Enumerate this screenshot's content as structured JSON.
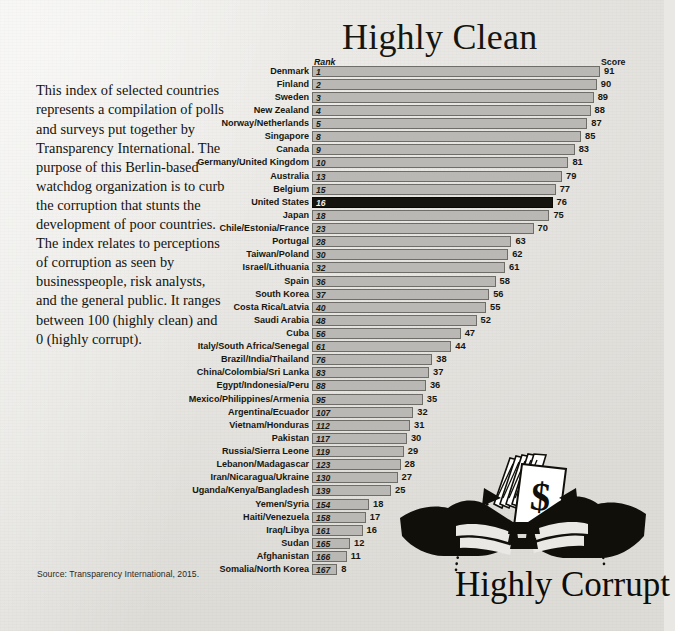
{
  "titles": {
    "top": "Highly Clean",
    "bottom": "Highly Corrupt"
  },
  "intro_paragraph": "This index of selected countries represents a compilation of polls and surveys put together by Transparency International. The purpose of this Berlin-based watchdog organization is to curb the corruption that stunts the development of poor countries. The index relates to perceptions of corruption as seen by businesspeople, risk analysts, and the general public. It ranges between 100 (highly clean) and 0 (highly corrupt).",
  "source": "Source: Transparency International, 2015.",
  "columns": {
    "rank": "Rank",
    "score": "Score"
  },
  "colors": {
    "paper": "#e9e8e4",
    "bar_fill": "#b9b8b4",
    "bar_stroke": "#6e6d68",
    "highlight_fill": "#15140f",
    "text": "#17160f"
  },
  "highlighted_row": "United States",
  "illustration": {
    "name": "bribery-handshake-money",
    "description": "Two black silhouetted hands passing a fan of dollar bills, with dotted curved arrows",
    "currency_symbol": "$"
  },
  "chart_data": {
    "type": "bar",
    "orientation": "horizontal",
    "title": "Highly Clean",
    "subtitle": "Highly Corrupt",
    "xlabel": "Score",
    "ylabel": "",
    "xlim": [
      0,
      91
    ],
    "grid": false,
    "legend": false,
    "value_labels": true,
    "categories": [
      "Denmark",
      "Finland",
      "Sweden",
      "New Zealand",
      "Norway/Netherlands",
      "Singapore",
      "Canada",
      "Germany/United Kingdom",
      "Australia",
      "Belgium",
      "United States",
      "Japan",
      "Chile/Estonia/France",
      "Portugal",
      "Taiwan/Poland",
      "Israel/Lithuania",
      "Spain",
      "South Korea",
      "Costa Rica/Latvia",
      "Saudi Arabia",
      "Cuba",
      "Italy/South Africa/Senegal",
      "Brazil/India/Thailand",
      "China/Colombia/Sri Lanka",
      "Egypt/Indonesia/Peru",
      "Mexico/Philippines/Armenia",
      "Argentina/Ecuador",
      "Vietnam/Honduras",
      "Pakistan",
      "Russia/Sierra Leone",
      "Lebanon/Madagascar",
      "Iran/Nicaragua/Ukraine",
      "Uganda/Kenya/Bangladesh",
      "Yemen/Syria",
      "Haiti/Venezuela",
      "Iraq/Libya",
      "Sudan",
      "Afghanistan",
      "Somalia/North Korea"
    ],
    "values": [
      91,
      90,
      89,
      88,
      87,
      85,
      83,
      81,
      79,
      77,
      76,
      75,
      70,
      63,
      62,
      61,
      58,
      56,
      55,
      52,
      47,
      44,
      38,
      37,
      36,
      35,
      32,
      31,
      30,
      29,
      28,
      27,
      25,
      18,
      17,
      16,
      12,
      11,
      8
    ],
    "ranks": [
      1,
      2,
      3,
      4,
      5,
      8,
      9,
      10,
      13,
      15,
      16,
      18,
      23,
      28,
      30,
      32,
      36,
      37,
      40,
      48,
      56,
      61,
      76,
      83,
      88,
      95,
      107,
      112,
      117,
      119,
      123,
      130,
      139,
      154,
      158,
      161,
      165,
      166,
      167
    ]
  },
  "rows": [
    {
      "country": "Denmark",
      "rank": "1",
      "score": "91"
    },
    {
      "country": "Finland",
      "rank": "2",
      "score": "90"
    },
    {
      "country": "Sweden",
      "rank": "3",
      "score": "89"
    },
    {
      "country": "New Zealand",
      "rank": "4",
      "score": "88"
    },
    {
      "country": "Norway/Netherlands",
      "rank": "5",
      "score": "87"
    },
    {
      "country": "Singapore",
      "rank": "8",
      "score": "85"
    },
    {
      "country": "Canada",
      "rank": "9",
      "score": "83"
    },
    {
      "country": "Germany/United Kingdom",
      "rank": "10",
      "score": "81"
    },
    {
      "country": "Australia",
      "rank": "13",
      "score": "79"
    },
    {
      "country": "Belgium",
      "rank": "15",
      "score": "77"
    },
    {
      "country": "United States",
      "rank": "16",
      "score": "76"
    },
    {
      "country": "Japan",
      "rank": "18",
      "score": "75"
    },
    {
      "country": "Chile/Estonia/France",
      "rank": "23",
      "score": "70"
    },
    {
      "country": "Portugal",
      "rank": "28",
      "score": "63"
    },
    {
      "country": "Taiwan/Poland",
      "rank": "30",
      "score": "62"
    },
    {
      "country": "Israel/Lithuania",
      "rank": "32",
      "score": "61"
    },
    {
      "country": "Spain",
      "rank": "36",
      "score": "58"
    },
    {
      "country": "South Korea",
      "rank": "37",
      "score": "56"
    },
    {
      "country": "Costa Rica/Latvia",
      "rank": "40",
      "score": "55"
    },
    {
      "country": "Saudi Arabia",
      "rank": "48",
      "score": "52"
    },
    {
      "country": "Cuba",
      "rank": "56",
      "score": "47"
    },
    {
      "country": "Italy/South Africa/Senegal",
      "rank": "61",
      "score": "44"
    },
    {
      "country": "Brazil/India/Thailand",
      "rank": "76",
      "score": "38"
    },
    {
      "country": "China/Colombia/Sri Lanka",
      "rank": "83",
      "score": "37"
    },
    {
      "country": "Egypt/Indonesia/Peru",
      "rank": "88",
      "score": "36"
    },
    {
      "country": "Mexico/Philippines/Armenia",
      "rank": "95",
      "score": "35"
    },
    {
      "country": "Argentina/Ecuador",
      "rank": "107",
      "score": "32"
    },
    {
      "country": "Vietnam/Honduras",
      "rank": "112",
      "score": "31"
    },
    {
      "country": "Pakistan",
      "rank": "117",
      "score": "30"
    },
    {
      "country": "Russia/Sierra Leone",
      "rank": "119",
      "score": "29"
    },
    {
      "country": "Lebanon/Madagascar",
      "rank": "123",
      "score": "28"
    },
    {
      "country": "Iran/Nicaragua/Ukraine",
      "rank": "130",
      "score": "27"
    },
    {
      "country": "Uganda/Kenya/Bangladesh",
      "rank": "139",
      "score": "25"
    },
    {
      "country": "Yemen/Syria",
      "rank": "154",
      "score": "18"
    },
    {
      "country": "Haiti/Venezuela",
      "rank": "158",
      "score": "17"
    },
    {
      "country": "Iraq/Libya",
      "rank": "161",
      "score": "16"
    },
    {
      "country": "Sudan",
      "rank": "165",
      "score": "12"
    },
    {
      "country": "Afghanistan",
      "rank": "166",
      "score": "11"
    },
    {
      "country": "Somalia/North Korea",
      "rank": "167",
      "score": "8"
    }
  ]
}
